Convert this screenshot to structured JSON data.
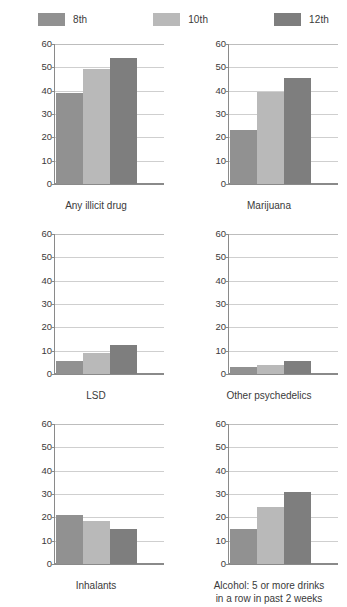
{
  "legend": {
    "items": [
      {
        "label": "8th",
        "color": "#919191"
      },
      {
        "label": "10th",
        "color": "#b9b9b9"
      },
      {
        "label": "12th",
        "color": "#7e7e7e"
      }
    ]
  },
  "axis": {
    "ticks": [
      "60",
      "50",
      "40",
      "30",
      "20",
      "10",
      "0"
    ]
  },
  "chart_data": {
    "type": "bar",
    "title": "",
    "xlabel": "",
    "ylabel": "",
    "ylim": [
      0,
      60
    ],
    "ytick_values": [
      0,
      10,
      20,
      30,
      40,
      50,
      60
    ],
    "grid": true,
    "legend_position": "top",
    "categories": [
      "8th",
      "10th",
      "12th"
    ],
    "panels": [
      {
        "label": "Any illicit drug",
        "label_line2": "",
        "values": [
          39,
          49.5,
          54
        ]
      },
      {
        "label": "Marijuana",
        "label_line2": "",
        "values": [
          23,
          39.5,
          45.5
        ]
      },
      {
        "label": "LSD",
        "label_line2": "",
        "values": [
          5.5,
          9,
          12.5
        ]
      },
      {
        "label": "Other psychedelics",
        "label_line2": "",
        "values": [
          3,
          4,
          5.5
        ]
      },
      {
        "label": "Inhalants",
        "label_line2": "",
        "values": [
          21,
          18.5,
          15
        ]
      },
      {
        "label": "Alcohol: 5 or more drinks",
        "label_line2": "in a row in past 2 weeks",
        "values": [
          15,
          24.5,
          31
        ]
      }
    ]
  }
}
